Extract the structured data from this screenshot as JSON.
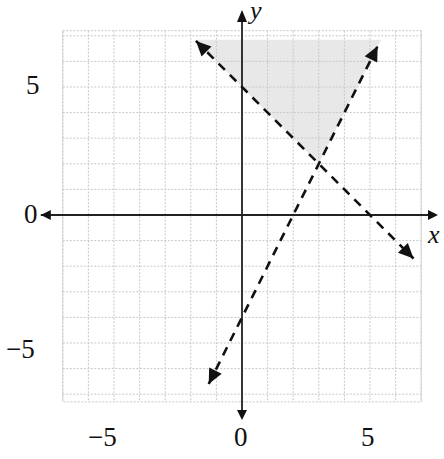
{
  "chart_data": {
    "type": "line",
    "title": "",
    "xlabel": "x",
    "ylabel": "y",
    "xlim": [
      -7,
      7
    ],
    "ylim": [
      -7.3,
      7.2
    ],
    "grid": true,
    "x_ticks": [
      "-5",
      "0",
      "5"
    ],
    "y_ticks": [
      "5",
      "0",
      "-5"
    ],
    "series": [
      {
        "name": "y = -x + 5",
        "style": "dashed",
        "slope": -1,
        "intercept": 5,
        "x": [
          -1.8,
          6.7
        ],
        "y": [
          6.8,
          -1.7
        ]
      },
      {
        "name": "y = 2x - 4",
        "style": "dashed",
        "slope": 2,
        "intercept": -4,
        "x": [
          -1.3,
          5.3
        ],
        "y": [
          -6.6,
          6.6
        ]
      }
    ],
    "intersection": [
      3,
      2
    ],
    "shaded_region": {
      "description": "y > -x + 5 and y > 2x - 4",
      "vertices": [
        [
          -1.85,
          6.85
        ],
        [
          3,
          2
        ],
        [
          5.43,
          6.85
        ]
      ],
      "color": "#e8e8e8"
    }
  },
  "labels": {
    "x_axis": "x",
    "y_axis": "y",
    "xtick_neg5": "−5",
    "xtick_0": "0",
    "xtick_5": "5",
    "ytick_5": "5",
    "ytick_0": "0",
    "ytick_neg5": "−5"
  }
}
